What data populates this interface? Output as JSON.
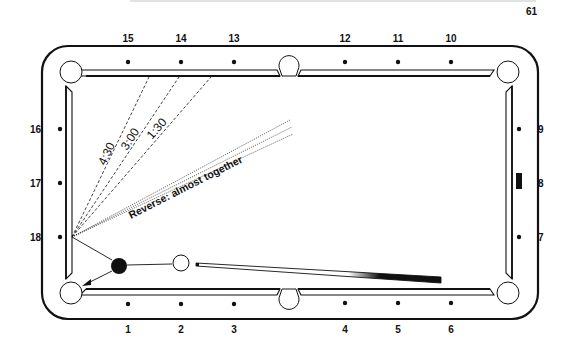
{
  "page": {
    "page_number": "61"
  },
  "diamonds": {
    "top": [
      "15",
      "14",
      "13",
      "12",
      "11",
      "10"
    ],
    "right": [
      "9",
      "8",
      "7"
    ],
    "bottom": [
      "1",
      "2",
      "3",
      "4",
      "5",
      "6"
    ],
    "left": [
      "16",
      "17",
      "18"
    ]
  },
  "annotations": {
    "angle_1": "4:30",
    "angle_2": "3:00",
    "angle_3": "1:30",
    "reverse": "Reverse: almost together"
  },
  "balls": {
    "object_ball": "solid black",
    "cue_ball": "white"
  },
  "colors": {
    "ink": "#111111",
    "paper": "#ffffff"
  }
}
